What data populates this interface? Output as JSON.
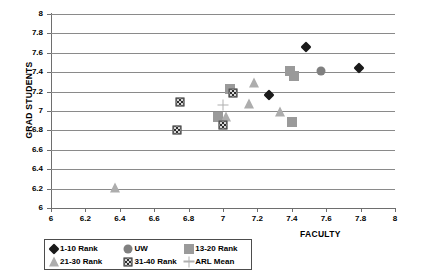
{
  "chart_data": {
    "type": "scatter",
    "title": "",
    "xlabel": "FACULTY",
    "ylabel": "GRAD STUDENTS",
    "xlim": [
      6,
      8
    ],
    "ylim": [
      6,
      8
    ],
    "xticks": [
      "6",
      "6.2",
      "6.4",
      "6.6",
      "6.8",
      "7",
      "7.2",
      "7.4",
      "7.6",
      "7.8",
      "8"
    ],
    "yticks": [
      "6",
      "6.2",
      "6.4",
      "6.6",
      "6.8",
      "7",
      "7.2",
      "7.4",
      "7.6",
      "7.8",
      "8"
    ],
    "xtick_values": [
      6,
      6.2,
      6.4,
      6.6,
      6.8,
      7,
      7.2,
      7.4,
      7.6,
      7.8,
      8
    ],
    "ytick_values": [
      6,
      6.2,
      6.4,
      6.6,
      6.8,
      7,
      7.2,
      7.4,
      7.6,
      7.8,
      8
    ],
    "grid": "horizontal",
    "legend_position": "bottom-left",
    "series": [
      {
        "name": "1-10 Rank",
        "marker": "diamond",
        "color": "#1a1a1a",
        "points": [
          {
            "x": 7.48,
            "y": 7.66
          },
          {
            "x": 7.79,
            "y": 7.44
          },
          {
            "x": 7.27,
            "y": 7.16
          }
        ]
      },
      {
        "name": "UW",
        "marker": "circle",
        "color": "#808080",
        "points": [
          {
            "x": 7.57,
            "y": 7.41
          }
        ]
      },
      {
        "name": "13-20 Rank",
        "marker": "square",
        "color": "#9a9a9a",
        "points": [
          {
            "x": 7.39,
            "y": 7.41
          },
          {
            "x": 7.41,
            "y": 7.36
          },
          {
            "x": 7.04,
            "y": 7.23
          },
          {
            "x": 6.97,
            "y": 6.94
          },
          {
            "x": 7.4,
            "y": 6.89
          }
        ]
      },
      {
        "name": "21-30 Rank",
        "marker": "triangle",
        "color": "#adadad",
        "points": [
          {
            "x": 7.18,
            "y": 7.29
          },
          {
            "x": 7.15,
            "y": 7.07
          },
          {
            "x": 7.33,
            "y": 6.99
          },
          {
            "x": 7.02,
            "y": 6.94
          },
          {
            "x": 6.37,
            "y": 6.21
          }
        ]
      },
      {
        "name": "31-40 Rank",
        "marker": "hatched-square",
        "color": "#2e2e2e",
        "points": [
          {
            "x": 7.06,
            "y": 7.19
          },
          {
            "x": 6.75,
            "y": 7.09
          },
          {
            "x": 7.0,
            "y": 6.86
          },
          {
            "x": 6.73,
            "y": 6.8
          }
        ]
      },
      {
        "name": "ARL Mean",
        "marker": "plus",
        "color": "#b0b0b0",
        "points": [
          {
            "x": 7.0,
            "y": 7.06
          }
        ]
      }
    ]
  },
  "legend": {
    "rows": [
      [
        {
          "label": "1-10 Rank",
          "marker": "diamond"
        },
        {
          "label": "UW",
          "marker": "circle"
        },
        {
          "label": "13-20 Rank",
          "marker": "square"
        }
      ],
      [
        {
          "label": "21-30 Rank",
          "marker": "triangle"
        },
        {
          "label": "31-40 Rank",
          "marker": "hatched-square"
        },
        {
          "label": "ARL Mean",
          "marker": "plus"
        }
      ]
    ]
  }
}
